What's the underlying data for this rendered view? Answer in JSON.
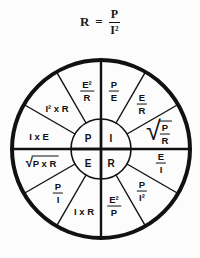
{
  "title": {
    "lhs": "R",
    "eq": "=",
    "num": "P",
    "den": "I²"
  },
  "wheel": {
    "colors": {
      "ink": "#111111",
      "background": "#fcfcfc"
    },
    "center_letters": {
      "top_left": "P",
      "top_right": "I",
      "bottom_left": "E",
      "bottom_right": "R"
    },
    "segments": {
      "ixe": {
        "quadrant": "P",
        "text": "I x E"
      },
      "i2r": {
        "quadrant": "P",
        "text": "I² x R"
      },
      "e2r": {
        "quadrant": "P",
        "num": "E²",
        "den": "R"
      },
      "pe": {
        "quadrant": "I",
        "num": "P",
        "den": "E"
      },
      "er": {
        "quadrant": "I",
        "num": "E",
        "den": "R"
      },
      "sqrt_pr": {
        "quadrant": "I",
        "sqrt": "√",
        "num": "P",
        "den": "R"
      },
      "sqrt_pxr": {
        "quadrant": "E",
        "sqrt": "√",
        "text": "P x R"
      },
      "pi": {
        "quadrant": "E",
        "num": "P",
        "den": "I"
      },
      "ixr": {
        "quadrant": "E",
        "text": "I x R"
      },
      "e2p": {
        "quadrant": "R",
        "num": "E²",
        "den": "P"
      },
      "pi2": {
        "quadrant": "R",
        "num": "P",
        "den": "I²"
      },
      "ei": {
        "quadrant": "R",
        "num": "E",
        "den": "I"
      }
    }
  }
}
